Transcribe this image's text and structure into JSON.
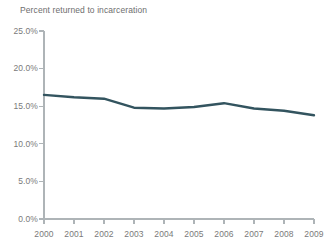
{
  "chart_data": {
    "type": "line",
    "title": "Percent returned to incarceration",
    "subtitle": "",
    "xlabel": "",
    "ylabel": "",
    "x": [
      2000,
      2001,
      2002,
      2003,
      2004,
      2005,
      2006,
      2007,
      2008,
      2009
    ],
    "categories": [
      "2000",
      "2001",
      "2002",
      "2003",
      "2004",
      "2005",
      "2006",
      "2007",
      "2008",
      "2009"
    ],
    "values": [
      16.5,
      16.2,
      16.0,
      14.8,
      14.7,
      14.9,
      15.4,
      14.7,
      14.4,
      13.8
    ],
    "series": [
      {
        "name": "Percent returned to incarceration",
        "values": [
          16.5,
          16.2,
          16.0,
          14.8,
          14.7,
          14.9,
          15.4,
          14.7,
          14.4,
          13.8
        ],
        "color": "#33545f"
      }
    ],
    "ylim": [
      0.0,
      25.0
    ],
    "xlim": [
      2000,
      2009
    ],
    "ytick_labels": [
      "25.0%",
      "20.0%",
      "15.0%",
      "10.0%",
      "5.0%",
      "0.0%"
    ],
    "ytick_values": [
      25.0,
      20.0,
      15.0,
      10.0,
      5.0,
      0.0
    ],
    "xtick_labels": [
      "2000",
      "2001",
      "2002",
      "2003",
      "2004",
      "2005",
      "2006",
      "2007",
      "2008",
      "2009"
    ],
    "grid": false,
    "legend": "none",
    "axis_color": "#aeb4b7",
    "tick_text_color": "#7a7a7a",
    "title_color": "#6e6e6e",
    "background": "#ffffff",
    "line_width": 2.4
  }
}
